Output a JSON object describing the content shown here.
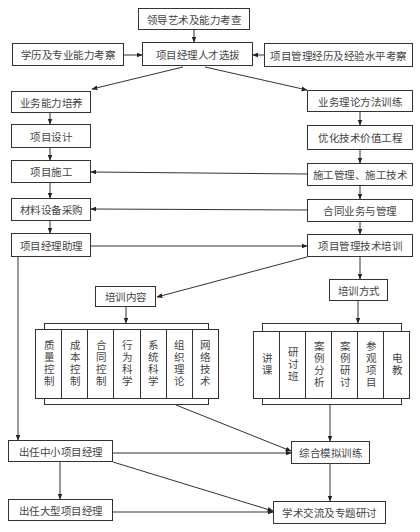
{
  "diagram": {
    "top": {
      "leadership": "领导艺术及能力考查",
      "education": "学历及专业能力考察",
      "selection": "项目经理人才选拔",
      "experience": "项目管理经历及经验水平考察"
    },
    "left_column": [
      "业务能力培养",
      "项目设计",
      "项目施工",
      "材料设备采购",
      "项目经理助理"
    ],
    "right_column": [
      "业务理论方法训练",
      "优化技术价值工程",
      "施工管理、施工技术",
      "合同业务与管理",
      "项目管理技术培训"
    ],
    "training_content": {
      "title": "培训内容",
      "items": [
        "质量控制",
        "成本控制",
        "合同控制",
        "行为科学",
        "系统科学",
        "组织理论",
        "网络技术"
      ]
    },
    "training_methods": {
      "title": "培训方式",
      "items": [
        "讲课",
        "研讨班",
        "案例分析",
        "案例研讨",
        "参观项目",
        "电教"
      ]
    },
    "bottom": {
      "small_pm": "出任中小项目经理",
      "simulation": "综合模拟训练",
      "large_pm": "出任大型项目经理",
      "academic": "学术交流及专题研讨"
    }
  }
}
